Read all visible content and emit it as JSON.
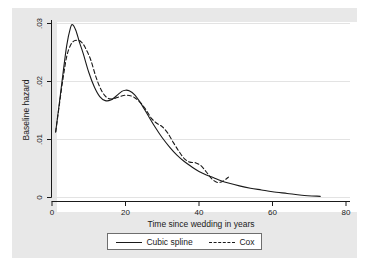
{
  "figure": {
    "background_color": "#e8e8e8",
    "plot_background_color": "#ffffff",
    "axis_color": "#1a1a1a",
    "grid_color": "#e0e0e0"
  },
  "axes": {
    "x_title": "Time since wedding in years",
    "y_title": "Baseline hazard",
    "x_ticks": [
      "0",
      "20",
      "40",
      "60",
      "80"
    ],
    "y_ticks": [
      ".03",
      ".02",
      ".01",
      "0"
    ]
  },
  "legend": {
    "entries": [
      {
        "label": "Cubic spline",
        "style": "solid",
        "icon": "solid-line-icon"
      },
      {
        "label": "Cox",
        "style": "dashed",
        "icon": "dashed-line-icon"
      }
    ]
  },
  "chart_data": {
    "type": "line",
    "title": "",
    "xlabel": "Time since wedding in years",
    "ylabel": "Baseline hazard",
    "xlim": [
      0,
      80
    ],
    "ylim": [
      0,
      0.03
    ],
    "grid": true,
    "legend_position": "bottom-outside",
    "series": [
      {
        "name": "Cubic spline",
        "style": "solid",
        "color": "#1a1a1a",
        "x": [
          1.0,
          2.0,
          3.0,
          4.0,
          5.0,
          5.6,
          6.5,
          7.5,
          8.5,
          10.0,
          11.5,
          13.0,
          14.5,
          16.0,
          17.5,
          19.0,
          20.0,
          21.0,
          22.5,
          24.0,
          26.0,
          28.0,
          30.0,
          32.0,
          34.0,
          36.0,
          38.0,
          40.0,
          42.0,
          44.0,
          46.0,
          48.0,
          51.0,
          54.0,
          57.0,
          60.0,
          64.0,
          68.0,
          73.0
        ],
        "y": [
          0.0113,
          0.0163,
          0.0214,
          0.0262,
          0.0292,
          0.0298,
          0.0288,
          0.0267,
          0.0248,
          0.0216,
          0.0191,
          0.0174,
          0.0167,
          0.0168,
          0.0175,
          0.0183,
          0.0185,
          0.0184,
          0.0177,
          0.0164,
          0.0143,
          0.0122,
          0.0103,
          0.0087,
          0.0073,
          0.0062,
          0.0053,
          0.0045,
          0.0039,
          0.0034,
          0.0029,
          0.0025,
          0.002,
          0.0016,
          0.0013,
          0.001,
          0.0007,
          0.0004,
          0.0002
        ]
      },
      {
        "name": "Cox",
        "style": "dashed",
        "color": "#1a1a1a",
        "x": [
          1.0,
          2.0,
          3.0,
          4.0,
          5.0,
          6.0,
          7.0,
          8.0,
          9.0,
          10.5,
          12.0,
          13.5,
          15.0,
          16.5,
          18.0,
          19.5,
          21.0,
          22.5,
          24.0,
          25.5,
          27.0,
          28.5,
          30.0,
          31.5,
          33.0,
          34.5,
          36.0,
          37.5,
          39.0,
          40.5,
          42.0,
          43.5,
          45.0,
          46.5,
          48.0
        ],
        "y": [
          0.0113,
          0.016,
          0.0205,
          0.0243,
          0.0262,
          0.027,
          0.0271,
          0.0268,
          0.0259,
          0.0238,
          0.0207,
          0.0184,
          0.0172,
          0.017,
          0.0173,
          0.0176,
          0.0176,
          0.0172,
          0.0164,
          0.0152,
          0.0137,
          0.0128,
          0.0122,
          0.0111,
          0.0095,
          0.008,
          0.0067,
          0.0061,
          0.006,
          0.0055,
          0.0044,
          0.0032,
          0.0026,
          0.0028,
          0.0035
        ]
      }
    ]
  }
}
